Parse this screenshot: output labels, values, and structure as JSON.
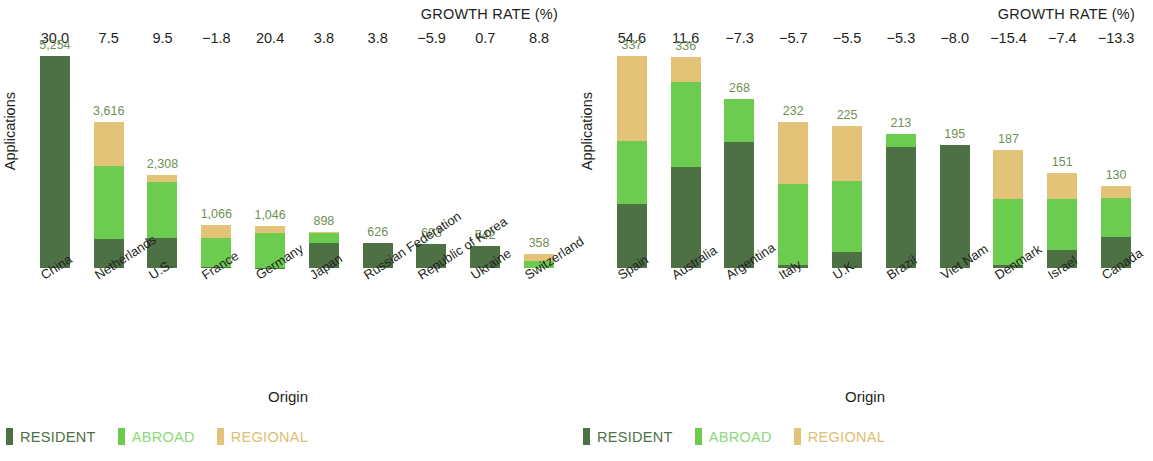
{
  "chart_data": [
    {
      "type": "bar",
      "id": "left",
      "subtype": "stacked-bar",
      "title": "",
      "header_label": "GROWTH RATE (%)",
      "xlabel": "Origin",
      "ylabel": "Applications",
      "ylim": [
        0,
        5254
      ],
      "grid": false,
      "legend_position": "bottom-left",
      "categories": [
        "China",
        "Netherlands",
        "U.S.",
        "France",
        "Germany",
        "Japan",
        "Russian Federation",
        "Republic of Korea",
        "Ukraine",
        "Switzerland"
      ],
      "totals": [
        5254,
        3616,
        2308,
        1066,
        1046,
        898,
        626,
        603,
        542,
        358
      ],
      "total_labels": [
        "5,254",
        "3,616",
        "2,308",
        "1,066",
        "1,046",
        "898",
        "626",
        "603",
        "542",
        "358"
      ],
      "growth_rate_labels": [
        "30.0",
        "7.5",
        "9.5",
        "−1.8",
        "20.4",
        "3.8",
        "3.8",
        "−5.9",
        "0.7",
        "8.8"
      ],
      "growth_rate_values": [
        30.0,
        7.5,
        9.5,
        -1.8,
        20.4,
        3.8,
        3.8,
        -5.9,
        0.7,
        8.8
      ],
      "series": [
        {
          "name": "RESIDENT",
          "color": "#4d7145",
          "values": [
            5254,
            723,
            739,
            21,
            10,
            629,
            626,
            603,
            542,
            0
          ]
        },
        {
          "name": "ABROAD",
          "color": "#6ccc4f",
          "values": [
            0,
            1808,
            1385,
            726,
            858,
            242,
            0,
            0,
            0,
            165
          ]
        },
        {
          "name": "REGIONAL",
          "color": "#e3c378",
          "values": [
            0,
            1085,
            184,
            319,
            178,
            27,
            0,
            0,
            0,
            193
          ]
        }
      ]
    },
    {
      "type": "bar",
      "id": "right",
      "subtype": "stacked-bar",
      "title": "",
      "header_label": "GROWTH RATE (%)",
      "xlabel": "Origin",
      "ylabel": "Applications",
      "ylim": [
        0,
        337
      ],
      "grid": false,
      "legend_position": "bottom-left",
      "categories": [
        "Spain",
        "Australia",
        "Argentina",
        "Italy",
        "U.K.",
        "Brazil",
        "Viet Nam",
        "Denmark",
        "Israel",
        "Canada"
      ],
      "totals": [
        337,
        336,
        268,
        232,
        225,
        213,
        195,
        187,
        151,
        130
      ],
      "total_labels": [
        "337",
        "336",
        "268",
        "232",
        "225",
        "213",
        "195",
        "187",
        "151",
        "130"
      ],
      "growth_rate_labels": [
        "54.6",
        "11.6",
        "−7.3",
        "−5.7",
        "−5.5",
        "−5.3",
        "−8.0",
        "−15.4",
        "−7.4",
        "−13.3"
      ],
      "growth_rate_values": [
        54.6,
        11.6,
        -7.3,
        -5.7,
        -5.5,
        -5.3,
        -8.0,
        -15.4,
        -7.4,
        -13.3
      ],
      "series": [
        {
          "name": "RESIDENT",
          "color": "#4d7145",
          "values": [
            101,
            161,
            201,
            5,
            26,
            192,
            195,
            5,
            29,
            49
          ]
        },
        {
          "name": "ABROAD",
          "color": "#6ccc4f",
          "values": [
            101,
            134,
            67,
            128,
            113,
            21,
            0,
            104,
            81,
            63
          ]
        },
        {
          "name": "REGIONAL",
          "color": "#e3c378",
          "values": [
            135,
            41,
            0,
            99,
            86,
            0,
            0,
            78,
            41,
            18
          ]
        }
      ]
    }
  ],
  "panels": [
    {
      "growth_title": "GROWTH RATE (%)",
      "y_axis_title": "Applications",
      "x_axis_title": "Origin",
      "legend": [
        {
          "label": "RESIDENT",
          "color": "#4d7145",
          "text_color": "#4d7145"
        },
        {
          "label": "ABROAD",
          "color": "#6ccc4f",
          "text_color": "#8bd97a"
        },
        {
          "label": "REGIONAL",
          "color": "#e3c378",
          "text_color": "#e0bd74"
        }
      ]
    },
    {
      "growth_title": "GROWTH RATE (%)",
      "y_axis_title": "Applications",
      "x_axis_title": "Origin",
      "legend": [
        {
          "label": "RESIDENT",
          "color": "#4d7145",
          "text_color": "#4d7145"
        },
        {
          "label": "ABROAD",
          "color": "#6ccc4f",
          "text_color": "#8bd97a"
        },
        {
          "label": "REGIONAL",
          "color": "#e3c378",
          "text_color": "#e0bd74"
        }
      ]
    }
  ],
  "colors": {
    "resident": "#4d7145",
    "abroad": "#6ccc4f",
    "regional": "#e3c378",
    "value_label": "#6f8f55",
    "text": "#231f20",
    "background": "#ffffff"
  }
}
